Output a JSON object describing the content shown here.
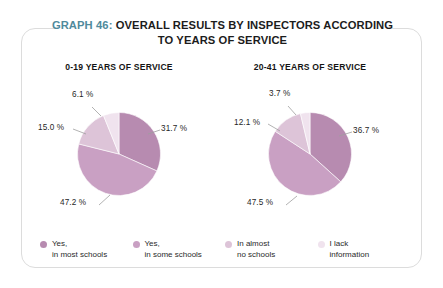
{
  "card": {
    "title_prefix": "GRAPH 46:",
    "title_main": "OVERALL RESULTS BY INSPECTORS ACCORDING TO YEARS OF SERVICE",
    "title_line1": "OVERALL RESULTS BY INSPECTORS ACCORDING",
    "title_line2": "TO YEARS OF SERVICE",
    "prefix_color": "#4f8a9c"
  },
  "panels": [
    {
      "caption": "0-19 YEARS OF SERVICE"
    },
    {
      "caption": "20-41 YEARS OF SERVICE"
    }
  ],
  "legend": {
    "items": [
      {
        "label": "Yes,\nin most schools",
        "color": "#b78bb0"
      },
      {
        "label": "Yes,\nin some schools",
        "color": "#c9a0c3"
      },
      {
        "label": "In almost\nno schools",
        "color": "#ddc4d8"
      },
      {
        "label": "I lack\ninformation",
        "color": "#f0e3ee"
      }
    ]
  },
  "labels": {
    "left": {
      "s1": "31.7 %",
      "s2": "47.2 %",
      "s3": "15.0 %",
      "s4": "6.1 %"
    },
    "right": {
      "s1": "36.7 %",
      "s2": "47.5 %",
      "s3": "12.1 %",
      "s4": "3.7 %"
    }
  },
  "chart_data": {
    "type": "pie",
    "title": "GRAPH 46: OVERALL RESULTS BY INSPECTORS ACCORDING TO YEARS OF SERVICE",
    "legend_position": "bottom",
    "grid": false,
    "categories": [
      "Yes, in most schools",
      "Yes, in some schools",
      "In almost no schools",
      "I lack information"
    ],
    "colors": [
      "#b78bb0",
      "#c9a0c3",
      "#ddc4d8",
      "#f0e3ee"
    ],
    "units": "percent",
    "charts": [
      {
        "name": "0-19 YEARS OF SERVICE",
        "values": [
          31.7,
          47.2,
          15.0,
          6.1
        ],
        "labels": [
          "31.7 %",
          "47.2 %",
          "15.0 %",
          "6.1 %"
        ]
      },
      {
        "name": "20-41 YEARS OF SERVICE",
        "values": [
          36.7,
          47.5,
          12.1,
          3.7
        ],
        "labels": [
          "36.7 %",
          "47.5 %",
          "12.1 %",
          "3.7 %"
        ]
      }
    ]
  }
}
